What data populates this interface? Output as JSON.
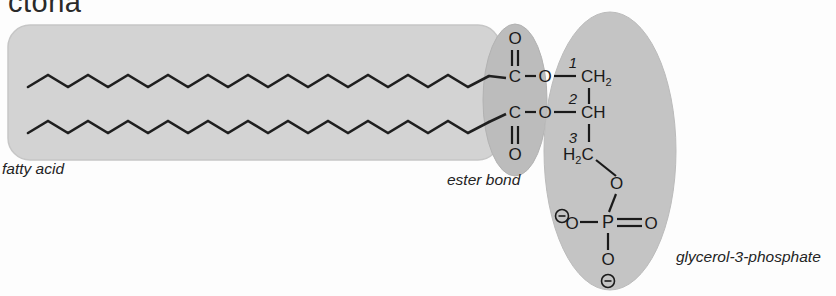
{
  "title": {
    "text": "ctona",
    "note": "cut-off heading at top edge"
  },
  "labels": {
    "fatty_acid": "fatty acid",
    "ester_bond": "ester bond",
    "glycerol_phosphate": "glycerol-3-phosphate"
  },
  "colors": {
    "chain_box_fill": "#d3d3d3",
    "chain_box_stroke": "#c0c0c0",
    "ester_ellipse_fill": "#bcbcbc",
    "glycerol_ellipse_fill": "#c4c4c4",
    "bond_stroke": "#1a1a1a",
    "text": "#1a1a1a",
    "page_background": "#fdfdfd"
  },
  "structure": {
    "type": "phosphatidic-acid",
    "atoms": {
      "carbonyl_upper_C": "C",
      "carbonyl_upper_O": "O",
      "ester_upper_O": "O",
      "carbonyl_lower_C": "C",
      "carbonyl_lower_O": "O",
      "ester_lower_O": "O",
      "glycerol_c1": "CH",
      "glycerol_c1_sub": "2",
      "glycerol_c2": "CH",
      "glycerol_c3": "H",
      "glycerol_c3_sub": "2",
      "glycerol_c3_tail": "C",
      "phospho_link_O": "O",
      "phosphorus": "P",
      "phospho_O_left": "O",
      "phospho_O_right": "O",
      "phospho_O_bottom": "O",
      "charge_left": "⊖",
      "charge_bottom": "⊖"
    },
    "carbon_numbers": {
      "c1": "1",
      "c2": "2",
      "c3": "3"
    },
    "fatty_acid_chains": 2,
    "chain_vertices_per_chain": 16
  }
}
